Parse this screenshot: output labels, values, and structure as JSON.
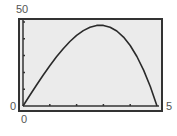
{
  "window": {
    "ymax_label": "50",
    "ymin_label": "0",
    "xmin_label": "0",
    "xmax_label": "5"
  },
  "colors": {
    "screen_bg": "#ebebeb",
    "border": "#333333",
    "curve": "#2a2a2a",
    "label": "#555555"
  },
  "chart_data": {
    "type": "line",
    "title": "",
    "xlabel": "",
    "ylabel": "",
    "xlim": [
      0,
      5
    ],
    "ylim": [
      0,
      50
    ],
    "xscale_tick": 1,
    "yscale_tick": 10,
    "grid": false,
    "legend": "none",
    "function": "y = 25x - x^3",
    "series": [
      {
        "name": "y1",
        "x": [
          0,
          0.25,
          0.5,
          0.75,
          1,
          1.25,
          1.5,
          1.75,
          2,
          2.25,
          2.5,
          2.75,
          2.887,
          3,
          3.25,
          3.5,
          3.75,
          4,
          4.25,
          4.5,
          4.75,
          5
        ],
        "values": [
          0,
          6.23,
          12.38,
          18.33,
          24,
          29.3,
          34.13,
          38.39,
          42,
          44.86,
          46.88,
          47.95,
          48.11,
          48,
          46.92,
          44.63,
          41.02,
          36,
          29.48,
          21.38,
          11.58,
          0
        ]
      }
    ],
    "annotations": [
      {
        "text": "50",
        "position": "top-left, ymax"
      },
      {
        "text": "0",
        "position": "left, ymin"
      },
      {
        "text": "0",
        "position": "bottom, xmin"
      },
      {
        "text": "5",
        "position": "right, xmax"
      }
    ]
  }
}
